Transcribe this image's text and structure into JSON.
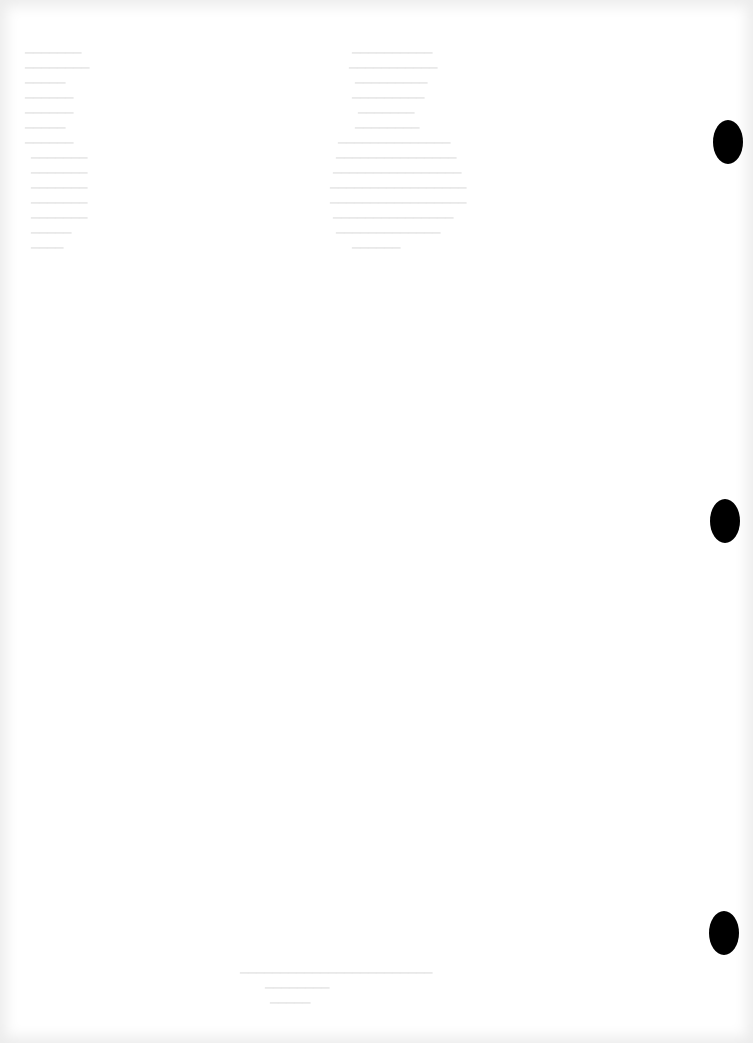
{
  "document": {
    "type": "scanned blank page",
    "background_color": "#ffffff",
    "edge_shadow_color": "#ececec",
    "show_through_text": "illegible bleed-through from reverse side",
    "punch_holes": [
      {
        "x": 713,
        "y": 120,
        "color": "#000000"
      },
      {
        "x": 710,
        "y": 499,
        "color": "#000000"
      },
      {
        "x": 709,
        "y": 911,
        "color": "#000000"
      }
    ]
  }
}
